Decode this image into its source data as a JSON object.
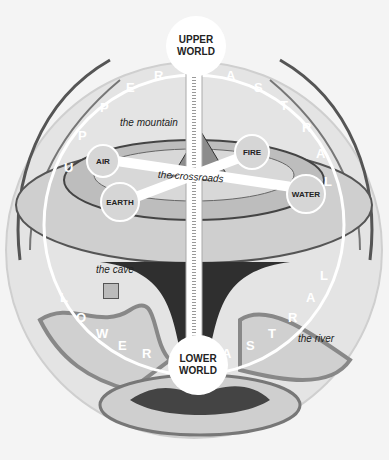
{
  "diagram": {
    "worlds": {
      "upper": {
        "line1": "UPPER",
        "line2": "WORLD"
      },
      "lower": {
        "line1": "LOWER",
        "line2": "WORLD"
      }
    },
    "elements": {
      "air": "AIR",
      "fire": "FIRE",
      "earth": "EARTH",
      "water": "WATER"
    },
    "places": {
      "mountain": "the mountain",
      "crossroads": "the crossroads",
      "cave": "the cave",
      "river": "the river"
    },
    "arc_labels": {
      "upper": [
        "U",
        "P",
        "P",
        "E",
        "R",
        "A",
        "S",
        "T",
        "R",
        "A",
        "L"
      ],
      "lower": [
        "L",
        "O",
        "W",
        "E",
        "R",
        "A",
        "S",
        "T",
        "R",
        "A",
        "L"
      ]
    },
    "colors": {
      "background": "#f4f4f4",
      "sphere": "#e2e2e2",
      "disc": "#c8c8c8",
      "node_fill": "#d6d6d6",
      "dark": "#2a2a2a",
      "white": "#ffffff"
    }
  }
}
